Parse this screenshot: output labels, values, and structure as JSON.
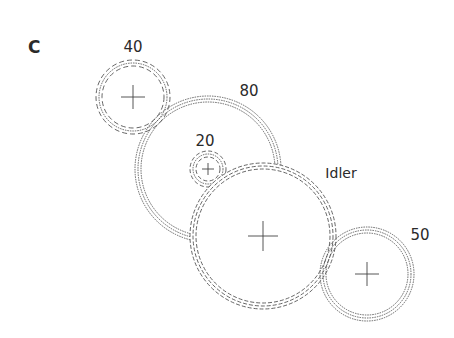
{
  "panel_label": "C",
  "colors": {
    "line": "#555555",
    "text": "#2a2a2a",
    "background": "#ffffff"
  },
  "gears": [
    {
      "id": "gear-40",
      "label": "40",
      "cx": 133,
      "cy": 97,
      "r": [
        37,
        34,
        31
      ],
      "style": "dashed",
      "label_x": 133,
      "label_y": 52
    },
    {
      "id": "gear-80",
      "label": "80",
      "cx": 208,
      "cy": 169,
      "r": [
        73,
        70,
        67
      ],
      "style": "dotted",
      "label_x": 249,
      "label_y": 96
    },
    {
      "id": "gear-20",
      "label": "20",
      "cx": 208,
      "cy": 169,
      "r": [
        18,
        15,
        12
      ],
      "style": "dashed",
      "label_x": 205,
      "label_y": 146
    },
    {
      "id": "gear-idler",
      "label": "Idler",
      "cx": 263,
      "cy": 236,
      "r": [
        73,
        70,
        67
      ],
      "style": "dashed",
      "label_x": 341,
      "label_y": 178
    },
    {
      "id": "gear-50",
      "label": "50",
      "cx": 367,
      "cy": 274,
      "r": [
        47,
        44,
        41
      ],
      "style": "dotted",
      "label_x": 420,
      "label_y": 240
    }
  ],
  "labels": {
    "g40": "40",
    "g80": "80",
    "g20": "20",
    "idler": "Idler",
    "g50": "50"
  }
}
